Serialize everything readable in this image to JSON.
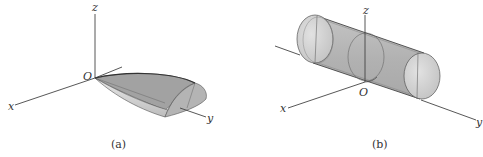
{
  "figures": [
    {
      "id": "a",
      "caption": "(a)",
      "description": "Half-paraboloid wedge solid with vertex at origin, extending along y-axis",
      "axes": {
        "x": "x",
        "y": "y",
        "z": "z",
        "origin": "O"
      }
    },
    {
      "id": "b",
      "caption": "(b)",
      "description": "Cylinder along y-axis centered at origin, with circular cross-sections",
      "axes": {
        "x": "x",
        "y": "y",
        "z": "z",
        "origin": "O"
      }
    }
  ],
  "colors": {
    "axis": "#444444",
    "shape_dark": "#9a9a9a",
    "shape_mid": "#b9b9b9",
    "shape_light": "#dcdcdc",
    "outline": "#555555"
  }
}
